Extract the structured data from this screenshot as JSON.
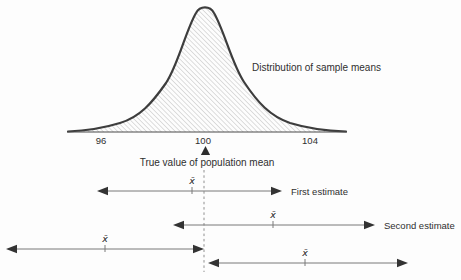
{
  "colors": {
    "ink": "#2f2f2f",
    "curve_stroke": "#3d3d3d",
    "arrow_line": "#787878",
    "arrowhead": "#333333",
    "hatch": "#bcbcbc",
    "dashed": "#8f8f8f",
    "background": "#fdfdfd"
  },
  "distribution": {
    "label": "Distribution of sample means",
    "axis_ticks": [
      "96",
      "100",
      "104"
    ],
    "pointer_label": "True value of population mean",
    "mean_symbol": "x̄"
  },
  "estimates": [
    {
      "label": "First estimate",
      "mean_symbol": "x̄",
      "x_start": 97,
      "x_end": 282,
      "xbar_x": 192,
      "y": 191
    },
    {
      "label": "Second estimate",
      "mean_symbol": "x̄",
      "x_start": 173,
      "x_end": 375,
      "xbar_x": 273,
      "y": 225
    },
    {
      "label": "",
      "mean_symbol": "x̄",
      "x_start": 6,
      "x_end": 204,
      "xbar_x": 105,
      "y": 249
    },
    {
      "label": "",
      "mean_symbol": "x̄",
      "x_start": 208,
      "x_end": 408,
      "xbar_x": 305,
      "y": 263
    }
  ]
}
